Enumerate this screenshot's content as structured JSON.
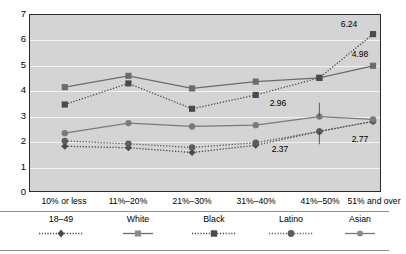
{
  "chart_data": {
    "type": "line",
    "title": "",
    "xlabel": "",
    "ylabel": "",
    "ylim": [
      0,
      7
    ],
    "ytick_labels": [
      "0",
      "1",
      "2",
      "3",
      "4",
      "5",
      "6",
      "7"
    ],
    "grid": true,
    "legend_position": "bottom",
    "categories": [
      "10% or less",
      "11%–20%",
      "21%–30%",
      "31%–40%",
      "41%–50%",
      "51% and over"
    ],
    "series": [
      {
        "name": "18–49",
        "marker": "diamond",
        "line": "dotted",
        "color": "#4a4a4a",
        "values": [
          1.78,
          1.72,
          1.53,
          1.82,
          2.37,
          2.77
        ]
      },
      {
        "name": "White",
        "marker": "square",
        "line": "solid",
        "color": "#6b6b6b",
        "values": [
          4.13,
          4.58,
          4.08,
          4.35,
          4.5,
          4.98
        ]
      },
      {
        "name": "Black",
        "marker": "square",
        "line": "dotted",
        "color": "#4a4a4a",
        "values": [
          3.44,
          4.28,
          3.27,
          3.82,
          4.5,
          6.24
        ]
      },
      {
        "name": "Latino",
        "marker": "circle",
        "line": "dotted",
        "color": "#5c5c5c",
        "values": [
          1.99,
          1.88,
          1.73,
          1.92,
          2.37,
          2.77
        ]
      },
      {
        "name": "Asian",
        "marker": "circle",
        "line": "solid",
        "color": "#7a7a7a",
        "values": [
          2.3,
          2.7,
          2.57,
          2.62,
          2.96,
          2.85
        ]
      }
    ],
    "annotations": [
      {
        "text": "6.24",
        "category_index": 5,
        "value": 6.24
      },
      {
        "text": "4.98",
        "category_index": 5,
        "value": 4.98
      },
      {
        "text": "2.96",
        "category_index": 4,
        "value": 2.96
      },
      {
        "text": "2.77",
        "category_index": 5,
        "value": 2.77
      },
      {
        "text": "2.37",
        "category_index": 4,
        "value": 2.37
      }
    ]
  },
  "axis": {
    "y_ticks": [
      "7",
      "6",
      "5",
      "4",
      "3",
      "2",
      "1",
      "0"
    ],
    "x_ticks": [
      "10% or less",
      "11%–20%",
      "21%–30%",
      "31%–40%",
      "41%–50%",
      "51% and over"
    ]
  },
  "legend": {
    "items": [
      {
        "label": "18–49"
      },
      {
        "label": "White"
      },
      {
        "label": "Black"
      },
      {
        "label": "Latino"
      },
      {
        "label": "Asian"
      }
    ]
  },
  "labels": {
    "l_624": "6.24",
    "l_498": "4.98",
    "l_296": "2.96",
    "l_277": "2.77",
    "l_237": "2.37"
  }
}
